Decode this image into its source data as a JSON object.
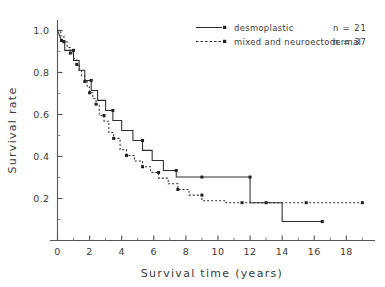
{
  "chart_data": {
    "type": "line",
    "title": "",
    "xlabel": "Survival time (years)",
    "ylabel": "Survival rate",
    "xlim": [
      0,
      19.6
    ],
    "ylim": [
      0,
      1.04
    ],
    "grid": false,
    "legend_position": "top-right",
    "x_ticks_major": [
      0,
      2,
      4,
      6,
      8,
      10,
      12,
      14,
      16,
      18
    ],
    "x_tick_labels": [
      "0",
      "2",
      "4",
      "6",
      "8",
      "10",
      "12",
      "14",
      "16",
      "18"
    ],
    "x_ticks_minor": [
      1,
      3,
      5,
      7,
      9,
      11,
      13,
      15,
      17,
      19
    ],
    "y_ticks_major": [
      0.2,
      0.4,
      0.6,
      0.8,
      1.0
    ],
    "y_tick_labels": [
      "0.2",
      "0.4",
      "0.6",
      "0.8",
      "1.0"
    ],
    "y_ticks_minor": [
      0.1,
      0.3,
      0.5,
      0.7,
      0.9
    ],
    "series": [
      {
        "name": "desmoplastic",
        "n_label": "n = 21",
        "n": 21,
        "style": "solid",
        "steps": [
          [
            0.0,
            1.0
          ],
          [
            0.25,
            0.952
          ],
          [
            0.45,
            0.952
          ],
          [
            0.45,
            0.905
          ],
          [
            0.75,
            0.905
          ],
          [
            0.75,
            0.905
          ],
          [
            1.0,
            0.905
          ],
          [
            1.0,
            0.857
          ],
          [
            1.35,
            0.857
          ],
          [
            1.35,
            0.81
          ],
          [
            1.7,
            0.81
          ],
          [
            1.7,
            0.762
          ],
          [
            2.1,
            0.762
          ],
          [
            2.1,
            0.714
          ],
          [
            2.5,
            0.714
          ],
          [
            2.5,
            0.667
          ],
          [
            3.0,
            0.667
          ],
          [
            3.0,
            0.619
          ],
          [
            3.45,
            0.619
          ],
          [
            3.45,
            0.571
          ],
          [
            4.0,
            0.571
          ],
          [
            4.0,
            0.524
          ],
          [
            4.7,
            0.524
          ],
          [
            4.7,
            0.476
          ],
          [
            5.3,
            0.476
          ],
          [
            5.3,
            0.429
          ],
          [
            5.9,
            0.429
          ],
          [
            5.9,
            0.381
          ],
          [
            6.6,
            0.381
          ],
          [
            6.6,
            0.333
          ],
          [
            7.4,
            0.333
          ],
          [
            7.4,
            0.302
          ],
          [
            9.0,
            0.302
          ],
          [
            9.0,
            0.302
          ],
          [
            12.0,
            0.302
          ],
          [
            12.0,
            0.18
          ],
          [
            14.0,
            0.18
          ],
          [
            14.0,
            0.09
          ],
          [
            16.5,
            0.09
          ]
        ],
        "censor_points": [
          [
            0.25,
            0.952
          ],
          [
            1.0,
            0.905
          ],
          [
            2.1,
            0.762
          ],
          [
            3.45,
            0.619
          ],
          [
            5.3,
            0.476
          ],
          [
            7.4,
            0.333
          ],
          [
            9.0,
            0.302
          ],
          [
            12.0,
            0.302
          ],
          [
            16.5,
            0.09
          ]
        ]
      },
      {
        "name": "mixed and neuroectodermal",
        "n_label": "n = 37",
        "n": 37,
        "style": "dashed",
        "steps": [
          [
            0.0,
            1.0
          ],
          [
            0.2,
            1.0
          ],
          [
            0.2,
            0.973
          ],
          [
            0.4,
            0.973
          ],
          [
            0.4,
            0.946
          ],
          [
            0.6,
            0.946
          ],
          [
            0.6,
            0.919
          ],
          [
            0.8,
            0.919
          ],
          [
            0.8,
            0.892
          ],
          [
            1.0,
            0.892
          ],
          [
            1.0,
            0.865
          ],
          [
            1.2,
            0.865
          ],
          [
            1.2,
            0.838
          ],
          [
            1.35,
            0.838
          ],
          [
            1.35,
            0.811
          ],
          [
            1.5,
            0.811
          ],
          [
            1.5,
            0.784
          ],
          [
            1.7,
            0.784
          ],
          [
            1.7,
            0.757
          ],
          [
            1.85,
            0.757
          ],
          [
            1.85,
            0.73
          ],
          [
            2.0,
            0.73
          ],
          [
            2.0,
            0.703
          ],
          [
            2.2,
            0.703
          ],
          [
            2.2,
            0.676
          ],
          [
            2.4,
            0.676
          ],
          [
            2.4,
            0.649
          ],
          [
            2.6,
            0.649
          ],
          [
            2.6,
            0.595
          ],
          [
            2.9,
            0.595
          ],
          [
            2.9,
            0.568
          ],
          [
            3.2,
            0.568
          ],
          [
            3.2,
            0.514
          ],
          [
            3.5,
            0.514
          ],
          [
            3.5,
            0.486
          ],
          [
            3.9,
            0.486
          ],
          [
            3.9,
            0.432
          ],
          [
            4.3,
            0.432
          ],
          [
            4.3,
            0.405
          ],
          [
            4.8,
            0.405
          ],
          [
            4.8,
            0.378
          ],
          [
            5.3,
            0.378
          ],
          [
            5.3,
            0.351
          ],
          [
            5.8,
            0.351
          ],
          [
            5.8,
            0.324
          ],
          [
            6.3,
            0.324
          ],
          [
            6.3,
            0.297
          ],
          [
            6.9,
            0.297
          ],
          [
            6.9,
            0.27
          ],
          [
            7.5,
            0.27
          ],
          [
            7.5,
            0.243
          ],
          [
            8.2,
            0.243
          ],
          [
            8.2,
            0.216
          ],
          [
            9.0,
            0.216
          ],
          [
            9.0,
            0.189
          ],
          [
            10.5,
            0.189
          ],
          [
            10.5,
            0.18
          ],
          [
            19.0,
            0.18
          ]
        ],
        "censor_points": [
          [
            0.4,
            0.946
          ],
          [
            0.8,
            0.892
          ],
          [
            1.2,
            0.838
          ],
          [
            1.7,
            0.757
          ],
          [
            2.0,
            0.703
          ],
          [
            2.4,
            0.649
          ],
          [
            2.9,
            0.595
          ],
          [
            3.5,
            0.486
          ],
          [
            4.3,
            0.405
          ],
          [
            5.3,
            0.351
          ],
          [
            6.3,
            0.324
          ],
          [
            7.5,
            0.243
          ],
          [
            9.0,
            0.216
          ],
          [
            11.5,
            0.18
          ],
          [
            13.0,
            0.18
          ],
          [
            15.5,
            0.18
          ],
          [
            19.0,
            0.18
          ]
        ]
      }
    ]
  },
  "legend": {
    "entries": [
      {
        "label": "desmoplastic",
        "n": "n = 21",
        "style": "solid"
      },
      {
        "label": "mixed and neuroectodermal",
        "n": "n = 37",
        "style": "dashed"
      }
    ]
  },
  "axes": {
    "x_title": "Survival time (years)",
    "y_title": "Survival rate"
  }
}
